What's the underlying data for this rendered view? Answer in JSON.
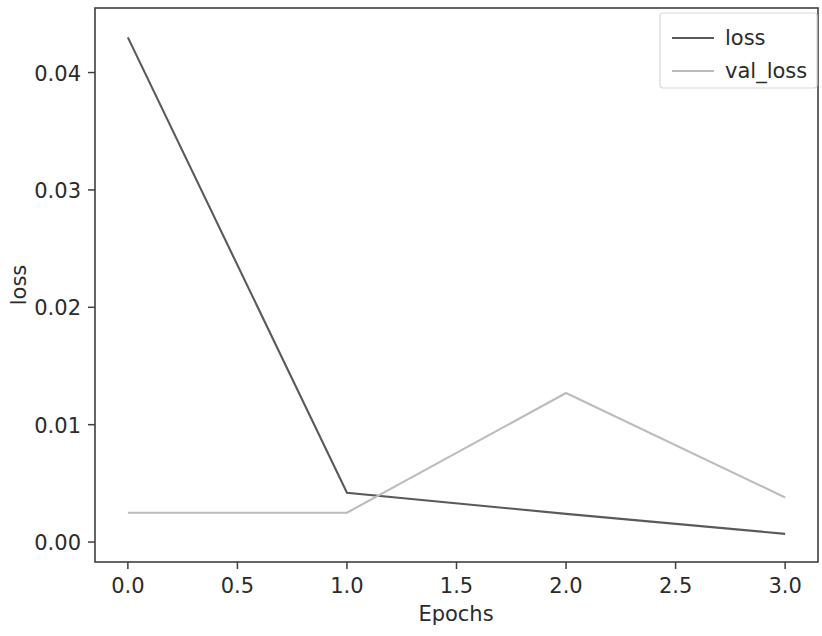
{
  "chart_data": {
    "type": "line",
    "title": "",
    "xlabel": "Epochs",
    "ylabel": "loss",
    "x": [
      0,
      1,
      2,
      3
    ],
    "series": [
      {
        "name": "loss",
        "color": "#5a5a5a",
        "values": [
          0.043,
          0.0042,
          0.0024,
          0.0007
        ]
      },
      {
        "name": "val_loss",
        "color": "#bcbcbc",
        "values": [
          0.0025,
          0.0025,
          0.0127,
          0.0038
        ]
      }
    ],
    "xlim": [
      -0.15,
      3.15
    ],
    "ylim": [
      -0.0017,
      0.0455
    ],
    "xticks": [
      0.0,
      0.5,
      1.0,
      1.5,
      2.0,
      2.5,
      3.0
    ],
    "xticklabels": [
      "0.0",
      "0.5",
      "1.0",
      "1.5",
      "2.0",
      "2.5",
      "3.0"
    ],
    "yticks": [
      0.0,
      0.01,
      0.02,
      0.03,
      0.04
    ],
    "yticklabels": [
      "0.00",
      "0.01",
      "0.02",
      "0.03",
      "0.04"
    ],
    "grid": false,
    "legend": {
      "position": "upper right",
      "entries": [
        "loss",
        "val_loss"
      ]
    },
    "axes_color": "#3f3f3f",
    "background": "#ffffff"
  },
  "figure": {
    "xlabel_text": "Epochs",
    "ylabel_text": "loss",
    "legend_entry_0": "loss",
    "legend_entry_1": "val_loss"
  }
}
